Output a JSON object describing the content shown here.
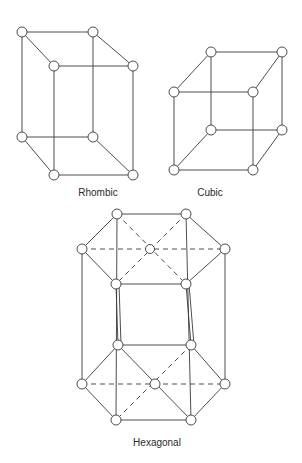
{
  "figure": {
    "lattices": [
      {
        "name": "Rhombic",
        "label_pos": [
          98,
          187
        ]
      },
      {
        "name": "Cubic",
        "label_pos": [
          210,
          187
        ]
      },
      {
        "name": "Hexagonal",
        "label_pos": [
          157,
          437
        ]
      }
    ]
  },
  "labels": {
    "rhombic": "Rhombic",
    "cubic": "Cubic",
    "hexagonal": "Hexagonal"
  }
}
